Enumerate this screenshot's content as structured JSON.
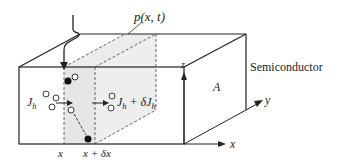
{
  "diagram": {
    "title_label": "p(x, t)",
    "material_label": "Semiconductor",
    "area_label": "A",
    "axes": {
      "x": "x",
      "y": "y",
      "z": "z"
    },
    "flux_in": {
      "symbol": "J",
      "subscript": "h"
    },
    "flux_out": {
      "symbol": "J",
      "subscript": "h",
      "suffix": " + δJ",
      "suffix_subscript": "h"
    },
    "position_left": "x",
    "position_right": "x + δx",
    "colors": {
      "line": "#222222",
      "slab_fill": "#e6e6e6",
      "dash": "#555555"
    }
  }
}
